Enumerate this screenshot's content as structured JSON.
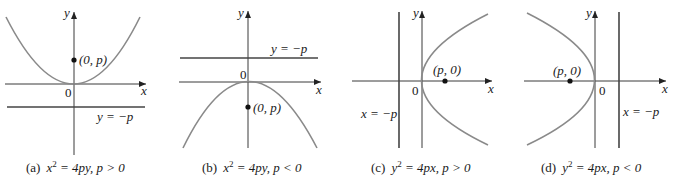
{
  "figure": {
    "panels": [
      {
        "id": "a",
        "caption_prefix": "(a)",
        "equation_lhs": "x",
        "equation_exp": "2",
        "equation_rhs": " = 4py, ",
        "condition": "p > 0",
        "y_axis_label": "y",
        "x_axis_label": "x",
        "origin_label": "0",
        "focus_label": "(0, p)",
        "directrix_label": "y = −p"
      },
      {
        "id": "b",
        "caption_prefix": "(b)",
        "equation_lhs": "x",
        "equation_exp": "2",
        "equation_rhs": " = 4py, ",
        "condition": "p < 0",
        "y_axis_label": "y",
        "x_axis_label": "x",
        "origin_label": "0",
        "focus_label": "(0, p)",
        "directrix_label": "y = −p"
      },
      {
        "id": "c",
        "caption_prefix": "(c)",
        "equation_lhs": "y",
        "equation_exp": "2",
        "equation_rhs": " = 4px, ",
        "condition": "p > 0",
        "y_axis_label": "y",
        "x_axis_label": "x",
        "origin_label": "0",
        "focus_label": "(p, 0)",
        "directrix_label": "x = −p"
      },
      {
        "id": "d",
        "caption_prefix": "(d)",
        "equation_lhs": "y",
        "equation_exp": "2",
        "equation_rhs": " = 4px, ",
        "condition": "p < 0",
        "y_axis_label": "y",
        "x_axis_label": "x",
        "origin_label": "0",
        "focus_label": "(p, 0)",
        "directrix_label": "x = −p"
      }
    ],
    "colors": {
      "axis": "#3a3a3a",
      "curve": "#8a8a8a",
      "directrix": "#444444",
      "focus_dot": "#111111",
      "text": "#1a1a1a"
    }
  }
}
